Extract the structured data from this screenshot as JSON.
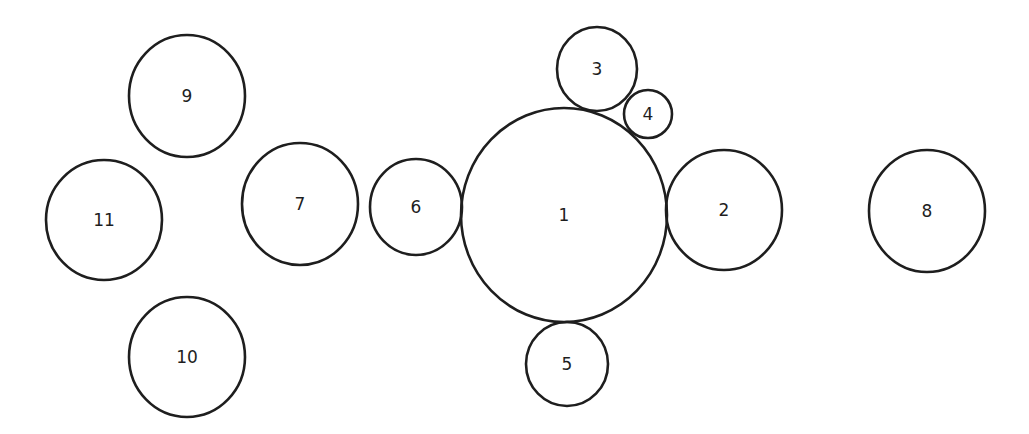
{
  "diagram": {
    "type": "circle-packing",
    "stroke_color": "#1e1e1e",
    "background": "#ffffff",
    "nodes": [
      {
        "label": "1",
        "cx": 564,
        "cy": 215,
        "rx": 103,
        "ry": 107
      },
      {
        "label": "2",
        "cx": 724,
        "cy": 210,
        "rx": 58,
        "ry": 60
      },
      {
        "label": "3",
        "cx": 597,
        "cy": 69,
        "rx": 40,
        "ry": 42
      },
      {
        "label": "4",
        "cx": 648,
        "cy": 114,
        "rx": 24,
        "ry": 24
      },
      {
        "label": "5",
        "cx": 567,
        "cy": 364,
        "rx": 41,
        "ry": 42
      },
      {
        "label": "6",
        "cx": 416,
        "cy": 207,
        "rx": 46,
        "ry": 48
      },
      {
        "label": "7",
        "cx": 300,
        "cy": 204,
        "rx": 58,
        "ry": 61
      },
      {
        "label": "8",
        "cx": 927,
        "cy": 211,
        "rx": 58,
        "ry": 61
      },
      {
        "label": "9",
        "cx": 187,
        "cy": 96,
        "rx": 58,
        "ry": 61
      },
      {
        "label": "10",
        "cx": 187,
        "cy": 357,
        "rx": 58,
        "ry": 60
      },
      {
        "label": "11",
        "cx": 104,
        "cy": 220,
        "rx": 58,
        "ry": 60
      }
    ]
  }
}
